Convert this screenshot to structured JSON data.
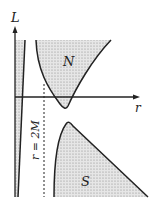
{
  "diagram": {
    "axes": {
      "y_label": "L",
      "x_label": "r"
    },
    "regions": [
      {
        "label": "N"
      },
      {
        "label": "S"
      }
    ],
    "dashed_line_label": "r = 2M",
    "colors": {
      "ink": "#222222",
      "fill": "#d4d4d4"
    }
  }
}
